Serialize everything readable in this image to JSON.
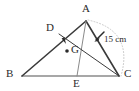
{
  "figure": {
    "background_color": "#ffffff",
    "stroke_color": "#3a3a3a",
    "base_stroke_color": "#8a8a8a",
    "arc_color": "#c9c9c9",
    "text_color": "#2b2b2b",
    "vertices": [
      {
        "name": "A",
        "label": "A",
        "x": 86,
        "y": 21,
        "label_x": 82,
        "label_y": 4
      },
      {
        "name": "B",
        "label": "B",
        "x": 22,
        "y": 76,
        "label_x": 6,
        "label_y": 69
      },
      {
        "name": "C",
        "label": "C",
        "x": 119,
        "y": 76,
        "label_x": 124,
        "label_y": 69
      },
      {
        "name": "D",
        "label": "D",
        "x": 59,
        "y": 34,
        "label_x": 46,
        "label_y": 23
      },
      {
        "name": "E",
        "label": "E",
        "x": 77,
        "y": 76,
        "label_x": 73,
        "label_y": 79
      },
      {
        "name": "G",
        "label": "G",
        "x": 67,
        "y": 51,
        "label_x": 71,
        "label_y": 44
      }
    ],
    "segments": [
      {
        "name": "side-AB",
        "from": "A",
        "to": "B",
        "style": "solid",
        "color": "#3a3a3a",
        "width": 1.5
      },
      {
        "name": "side-AC",
        "from": "A",
        "to": "C",
        "style": "solid",
        "color": "#3a3a3a",
        "width": 1.5
      },
      {
        "name": "side-BC",
        "from": "B",
        "to": "C",
        "style": "solid",
        "color": "#8a8a8a",
        "width": 1.5
      },
      {
        "name": "median-DC",
        "from": "D",
        "to": "C",
        "style": "solid",
        "color": "#3a3a3a",
        "width": 1.0
      },
      {
        "name": "median-AE",
        "from": "A",
        "to": "E",
        "style": "solid",
        "color": "#8a8a8a",
        "width": 1.0
      }
    ],
    "points": [
      {
        "name": "centroid-point-G",
        "x": 67,
        "y": 51
      }
    ],
    "arc": {
      "name": "dotted-arc-A-to-C",
      "style": "dotted",
      "color": "#c9c9c9",
      "from": "A",
      "to": "C"
    },
    "annotations": [
      {
        "name": "dimension-15cm",
        "text": "15 cm",
        "label_x": 101,
        "label_y": 36,
        "leader_from_x": 104,
        "leader_from_y": 33,
        "leader_to_x": 95,
        "leader_to_y": 42,
        "target_segment": "side-AC"
      },
      {
        "name": "tick-arrow-at-D",
        "text": "",
        "leader_from_x": 60,
        "leader_from_y": 34,
        "leader_to_x": 65,
        "leader_to_y": 42,
        "target_segment": "median-DC"
      }
    ]
  }
}
